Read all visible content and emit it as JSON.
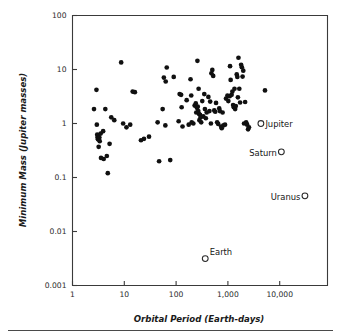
{
  "figure": {
    "name": "exoplanet-minimum-mass-vs-orbital-period",
    "background": "#ffffff",
    "marker_color": "#101010",
    "axis_color": "#3a3a3a"
  },
  "chart_data": {
    "type": "scatter",
    "title": "",
    "xlabel": "Orbital Period (Earth-days)",
    "ylabel": "Minimum Mass (Jupiter masses)",
    "xscale": "log",
    "yscale": "log",
    "xlim": [
      1,
      79000
    ],
    "ylim": [
      0.001,
      100
    ],
    "grid": false,
    "legend": "none",
    "xticks": [
      1,
      10,
      100,
      1000,
      10000
    ],
    "xticklabels": [
      "1",
      "10",
      "100",
      "1,000",
      "10,000"
    ],
    "yticks": [
      100,
      10,
      1,
      0.1,
      0.01,
      0.001
    ],
    "yticklabels": [
      "100",
      "10",
      "1",
      "0.1",
      "0.01",
      "0.001"
    ],
    "series": [
      {
        "name": "Extrasolar planets",
        "marker": "filled-circle",
        "color": "#101010",
        "points": [
          [
            2.6,
            1.85
          ],
          [
            2.9,
            4.2
          ],
          [
            2.95,
            0.95
          ],
          [
            3.0,
            0.62
          ],
          [
            3.05,
            0.55
          ],
          [
            3.1,
            0.51
          ],
          [
            3.15,
            0.58
          ],
          [
            3.2,
            0.37
          ],
          [
            3.3,
            0.55
          ],
          [
            3.35,
            0.47
          ],
          [
            3.5,
            0.65
          ],
          [
            3.55,
            0.23
          ],
          [
            3.9,
            0.72
          ],
          [
            4.0,
            0.22
          ],
          [
            4.3,
            1.85
          ],
          [
            4.6,
            0.25
          ],
          [
            4.8,
            0.12
          ],
          [
            5.2,
            0.42
          ],
          [
            5.6,
            1.3
          ],
          [
            6.4,
            1.15
          ],
          [
            8.7,
            13.5
          ],
          [
            9.5,
            1.0
          ],
          [
            11.0,
            0.85
          ],
          [
            13.0,
            0.95
          ],
          [
            14.5,
            3.9
          ],
          [
            16.0,
            3.8
          ],
          [
            21.0,
            0.49
          ],
          [
            24.0,
            0.52
          ],
          [
            30.0,
            0.57
          ],
          [
            44.0,
            1.05
          ],
          [
            47.0,
            0.2
          ],
          [
            55.0,
            1.85
          ],
          [
            58.0,
            7.1
          ],
          [
            62.0,
            0.92
          ],
          [
            63.0,
            6.0
          ],
          [
            66.0,
            10.9
          ],
          [
            77.0,
            0.21
          ],
          [
            90.0,
            7.3
          ],
          [
            112.0,
            1.1
          ],
          [
            117.0,
            3.5
          ],
          [
            125.0,
            3.4
          ],
          [
            128.0,
            2.0
          ],
          [
            133.0,
            0.88
          ],
          [
            160.0,
            2.7
          ],
          [
            175.0,
            0.95
          ],
          [
            190.0,
            6.6
          ],
          [
            196.0,
            3.3
          ],
          [
            200.0,
            1.05
          ],
          [
            215.0,
            1.0
          ],
          [
            228.0,
            2.15
          ],
          [
            240.0,
            2.35
          ],
          [
            245.0,
            1.6
          ],
          [
            252.0,
            1.95
          ],
          [
            258.0,
            14.5
          ],
          [
            262.0,
            2.05
          ],
          [
            268.0,
            1.7
          ],
          [
            272.0,
            4.4
          ],
          [
            278.0,
            1.5
          ],
          [
            282.0,
            1.15
          ],
          [
            290.0,
            1.45
          ],
          [
            298.0,
            1.3
          ],
          [
            305.0,
            1.05
          ],
          [
            320.0,
            2.6
          ],
          [
            335.0,
            1.35
          ],
          [
            350.0,
            3.5
          ],
          [
            360.0,
            1.85
          ],
          [
            375.0,
            1.25
          ],
          [
            390.0,
            1.6
          ],
          [
            420.0,
            3.1
          ],
          [
            440.0,
            1.7
          ],
          [
            455.0,
            2.55
          ],
          [
            470.0,
            1.0
          ],
          [
            480.0,
            8.5
          ],
          [
            500.0,
            9.8
          ],
          [
            520.0,
            7.6
          ],
          [
            545.0,
            1.75
          ],
          [
            570.0,
            1.65
          ],
          [
            590.0,
            2.4
          ],
          [
            620.0,
            1.05
          ],
          [
            650.0,
            0.98
          ],
          [
            680.0,
            1.9
          ],
          [
            700.0,
            1.7
          ],
          [
            740.0,
            0.88
          ],
          [
            760.0,
            0.82
          ],
          [
            790.0,
            1.6
          ],
          [
            820.0,
            0.92
          ],
          [
            880.0,
            0.95
          ],
          [
            920.0,
            2.9
          ],
          [
            980.0,
            3.3
          ],
          [
            1020.0,
            2.6
          ],
          [
            1080.0,
            3.2
          ],
          [
            1100.0,
            11.5
          ],
          [
            1130.0,
            6.4
          ],
          [
            1180.0,
            3.4
          ],
          [
            1220.0,
            3.9
          ],
          [
            1260.0,
            2.2
          ],
          [
            1300.0,
            2.0
          ],
          [
            1340.0,
            4.4
          ],
          [
            1380.0,
            1.85
          ],
          [
            1420.0,
            2.1
          ],
          [
            1480.0,
            8.1
          ],
          [
            1520.0,
            7.3
          ],
          [
            1560.0,
            3.05
          ],
          [
            1600.0,
            16.5
          ],
          [
            1660.0,
            4.4
          ],
          [
            1720.0,
            2.45
          ],
          [
            1800.0,
            12.2
          ],
          [
            1860.0,
            11.0
          ],
          [
            1920.0,
            7.4
          ],
          [
            1980.0,
            9.5
          ],
          [
            2050.0,
            1.0
          ],
          [
            2150.0,
            2.5
          ],
          [
            2250.0,
            1.05
          ],
          [
            2350.0,
            0.95
          ],
          [
            2450.0,
            0.78
          ],
          [
            2550.0,
            0.85
          ],
          [
            5200.0,
            4.1
          ]
        ]
      },
      {
        "name": "Solar System planets",
        "marker": "open-circle",
        "color": "#2a2a2a",
        "points": [
          {
            "label": "Jupiter",
            "x": 4333,
            "y": 1.0,
            "label_side": "right"
          },
          {
            "label": "Saturn",
            "x": 10760,
            "y": 0.299,
            "label_side": "left"
          },
          {
            "label": "Uranus",
            "x": 30700,
            "y": 0.0457,
            "label_side": "left"
          },
          {
            "label": "Earth",
            "x": 365,
            "y": 0.00315,
            "label_side": "right-top"
          }
        ]
      }
    ]
  }
}
